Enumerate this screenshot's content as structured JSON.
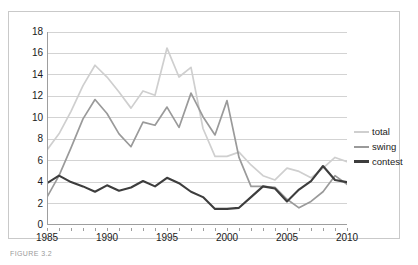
{
  "figure": {
    "caption": "FIGURE 3.2"
  },
  "legend": {
    "position": "right",
    "items": [
      {
        "label": "total",
        "color": "#cfcfcf"
      },
      {
        "label": "swing",
        "color": "#9a9a9a"
      },
      {
        "label": "contest",
        "color": "#3d3d3d"
      }
    ]
  },
  "axes": {
    "y_ticks": [
      0,
      2,
      4,
      6,
      8,
      10,
      12,
      14,
      16,
      18
    ],
    "x_ticks_labeled": [
      1985,
      1990,
      1995,
      2000,
      2005,
      2010
    ],
    "x_ticks_all": [
      1985,
      1986,
      1987,
      1988,
      1989,
      1990,
      1991,
      1992,
      1993,
      1994,
      1995,
      1996,
      1997,
      1998,
      1999,
      2000,
      2001,
      2002,
      2003,
      2004,
      2005,
      2006,
      2007,
      2008,
      2009,
      2010
    ]
  },
  "chart_data": {
    "type": "line",
    "title": "",
    "xlabel": "",
    "ylabel": "",
    "xlim": [
      1985,
      2010
    ],
    "ylim": [
      0,
      18
    ],
    "grid": true,
    "legend_position": "right",
    "x": [
      1985,
      1986,
      1987,
      1988,
      1989,
      1990,
      1991,
      1992,
      1993,
      1994,
      1995,
      1996,
      1997,
      1998,
      1999,
      2000,
      2001,
      2002,
      2003,
      2004,
      2005,
      2006,
      2007,
      2008,
      2009,
      2010
    ],
    "series": [
      {
        "name": "total",
        "color": "#cfcfcf",
        "values": [
          7.0,
          8.5,
          10.6,
          13.0,
          14.9,
          13.8,
          12.4,
          10.9,
          12.5,
          12.1,
          16.5,
          13.8,
          14.7,
          9.0,
          6.4,
          6.4,
          6.8,
          5.6,
          4.6,
          4.2,
          5.3,
          5.0,
          4.4,
          5.3,
          6.3,
          5.9
        ]
      },
      {
        "name": "swing",
        "color": "#9a9a9a",
        "values": [
          2.6,
          4.6,
          7.2,
          9.9,
          11.7,
          10.4,
          8.5,
          7.3,
          9.6,
          9.3,
          11.0,
          9.1,
          12.3,
          10.1,
          8.4,
          11.6,
          6.3,
          3.6,
          3.6,
          3.5,
          2.4,
          1.6,
          2.2,
          3.1,
          4.6,
          3.8
        ]
      },
      {
        "name": "contest",
        "color": "#3d3d3d",
        "values": [
          3.9,
          4.6,
          4.0,
          3.6,
          3.1,
          3.7,
          3.2,
          3.5,
          4.1,
          3.6,
          4.4,
          3.9,
          3.1,
          2.6,
          1.5,
          1.5,
          1.6,
          2.6,
          3.6,
          3.4,
          2.2,
          3.3,
          4.1,
          5.5,
          4.2,
          4.0
        ]
      }
    ]
  }
}
